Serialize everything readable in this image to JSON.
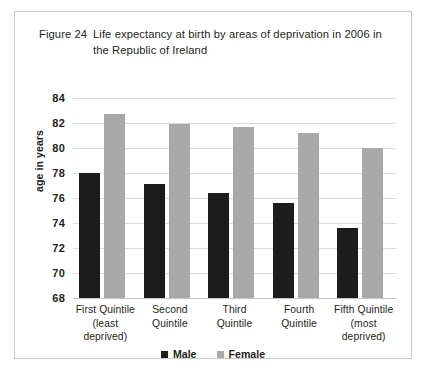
{
  "figure": {
    "number": "Figure 24",
    "title": "Life expectancy at birth by areas of deprivation in 2006 in the Republic of Ireland"
  },
  "legend": {
    "position": "bottom-center",
    "items": [
      {
        "label": "Male",
        "color": "#1c1c1c",
        "swatch": "male-swatch"
      },
      {
        "label": "Female",
        "color": "#a9a9a9",
        "swatch": "female-swatch"
      }
    ]
  },
  "axes": {
    "y_title": "age in years",
    "y_ticks": [
      "84",
      "82",
      "80",
      "78",
      "76",
      "74",
      "72",
      "70",
      "68"
    ],
    "x_ticks": [
      "First Quintile (least deprived)",
      "Second Quintile",
      "Third Quintile",
      "Fourth Quintile",
      "Fifth Quintile (most deprived)"
    ]
  },
  "chart_data": {
    "type": "bar",
    "title": "Life expectancy at birth by areas of deprivation in 2006 in the Republic of Ireland",
    "xlabel": "",
    "ylabel": "age in years",
    "ylim": [
      68,
      84
    ],
    "ytick_step": 2,
    "grid": true,
    "legend_position": "bottom-center",
    "categories": [
      "First Quintile (least deprived)",
      "Second Quintile",
      "Third Quintile",
      "Fourth Quintile",
      "Fifth Quintile (most deprived)"
    ],
    "category_lines": [
      [
        "First Quintile",
        "(least",
        "deprived)"
      ],
      [
        "Second",
        "Quintile",
        ""
      ],
      [
        "Third",
        "Quintile",
        ""
      ],
      [
        "Fourth",
        "Quintile",
        ""
      ],
      [
        "Fifth Quintile",
        "(most",
        "deprived)"
      ]
    ],
    "series": [
      {
        "name": "Male",
        "color": "#1c1c1c",
        "values": [
          78.0,
          77.1,
          76.4,
          75.6,
          73.6
        ]
      },
      {
        "name": "Female",
        "color": "#a9a9a9",
        "values": [
          82.7,
          81.9,
          81.7,
          81.2,
          80.0
        ]
      }
    ]
  }
}
